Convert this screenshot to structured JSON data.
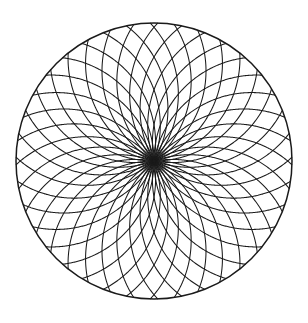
{
  "document": {
    "title": "Geometric Rose Mandala",
    "background_color": "#ffffff",
    "width": 308,
    "height": 323
  },
  "chart_data": {
    "type": "scatter",
    "subtitle": "",
    "xlabel": "",
    "ylabel": "",
    "grid": false,
    "legend": null,
    "axes_visible": false,
    "tick_labels": [],
    "annotations": [],
    "geometry": {
      "center": {
        "x": 154,
        "y": 161
      },
      "outer_radius": 138,
      "arc_count": 18,
      "arc_radius": 104,
      "arc_offset_ratio": 0.62,
      "rotation_step_degrees": 20,
      "phase_offset_degrees": 0,
      "secondary_arc_count": 18,
      "secondary_arc_radius": 104,
      "secondary_phase_offset_degrees": 10,
      "chord_sweep_degrees": 250
    },
    "style": {
      "stroke_color": "#1a1a1a",
      "stroke_width": 1.05,
      "outer_stroke_width": 1.5,
      "fill": "none",
      "line_cap": "round"
    }
  },
  "elements": {
    "outer_circle_name": "outer-boundary-circle",
    "arc_family_primary_name": "arc-family-primary",
    "arc_family_secondary_name": "arc-family-secondary",
    "center_node_name": "center-convergence-point"
  }
}
